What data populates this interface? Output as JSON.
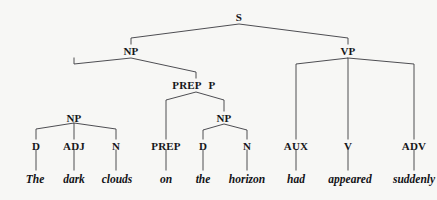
{
  "diagram": {
    "type": "constituency-parse-tree",
    "sentence": "The dark clouds on the horizon had appeared suddenly",
    "colors": {
      "background": "#f7f7f5",
      "line": "#3a3a40",
      "text": "#16161a"
    }
  },
  "nodes": {
    "s": {
      "label": "S",
      "x": 239,
      "y": 17
    },
    "np_subject": {
      "label": "NP",
      "x": 131,
      "y": 51
    },
    "vp": {
      "label": "VP",
      "x": 348,
      "y": 51
    },
    "np_inner": {
      "label": "NP",
      "x": 74,
      "y": 118
    },
    "prep_phrase_left": {
      "label": "PREP",
      "x": 187,
      "y": 85
    },
    "prep_phrase_right": {
      "label": "P",
      "x": 212,
      "y": 85
    },
    "np_object": {
      "label": "NP",
      "x": 224,
      "y": 118
    }
  },
  "pos_tags": [
    {
      "label": "D",
      "x": 36,
      "y": 146
    },
    {
      "label": "ADJ",
      "x": 74,
      "y": 146
    },
    {
      "label": "N",
      "x": 116,
      "y": 146
    },
    {
      "label": "PREP",
      "x": 166,
      "y": 146
    },
    {
      "label": "D",
      "x": 203,
      "y": 146
    },
    {
      "label": "N",
      "x": 247,
      "y": 146
    },
    {
      "label": "AUX",
      "x": 296,
      "y": 146
    },
    {
      "label": "V",
      "x": 348,
      "y": 146
    },
    {
      "label": "ADV",
      "x": 414,
      "y": 146
    }
  ],
  "words": [
    {
      "text": "The",
      "x": 35,
      "y": 182
    },
    {
      "text": "dark",
      "x": 74,
      "y": 182
    },
    {
      "text": "clouds",
      "x": 117,
      "y": 182
    },
    {
      "text": "on",
      "x": 166,
      "y": 182
    },
    {
      "text": "the",
      "x": 203,
      "y": 182
    },
    {
      "text": "horizon",
      "x": 247,
      "y": 182
    },
    {
      "text": "had",
      "x": 296,
      "y": 182
    },
    {
      "text": "appeared",
      "x": 350,
      "y": 182
    },
    {
      "text": "suddenly",
      "x": 414,
      "y": 182
    }
  ],
  "edges": {
    "s_to_children": "M 131,44 L 131,38 L 239,24 L 348,38 L 348,44",
    "np_subject_to_children": "M 74,58 L 74,64 L 131,58 L 196,72 L 196,78",
    "prep_p_to_children": "M 166,139 L 166,100 L 196,92 L 224,100 L 224,111",
    "np_inner_to_children": "M 36,139 L 36,129 L 74,123 L 74,139 M 74,123 L 116,129 L 116,139",
    "np_object_to_children": "M 203,139 L 203,130 L 224,124 L 247,130 L 247,139",
    "vp_to_children": "M 296,139 L 296,64 L 348,58 L 348,139 M 348,58 L 414,64 L 414,139",
    "leaf_stems": [
      "M 36,150 L 36,170",
      "M 74,150 L 74,170",
      "M 116,150 L 116,170",
      "M 166,150 L 166,170",
      "M 203,150 L 203,170",
      "M 247,150 L 247,170",
      "M 296,150 L 296,170",
      "M 348,150 L 348,170",
      "M 414,150 L 414,170"
    ]
  }
}
